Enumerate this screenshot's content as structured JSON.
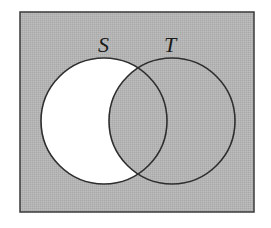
{
  "diagram": {
    "type": "venn",
    "universe": {
      "x": 20,
      "y": 12,
      "width": 234,
      "height": 200,
      "fill": "#b4b4b4",
      "stroke": "#3a3a3a"
    },
    "sets": [
      {
        "label": "S",
        "cx": 104,
        "cy": 121,
        "r": 63,
        "label_x": 98,
        "label_y": 52
      },
      {
        "label": "T",
        "cx": 172,
        "cy": 121,
        "r": 63,
        "label_x": 164,
        "label_y": 52
      }
    ],
    "colors": {
      "shaded": "#b4b4b4",
      "unshaded": "#ffffff",
      "outline": "#2e2e2e"
    },
    "regions": {
      "S_only": "unshaded",
      "S_and_T": "shaded",
      "T_only": "shaded",
      "outside": "shaded"
    }
  }
}
